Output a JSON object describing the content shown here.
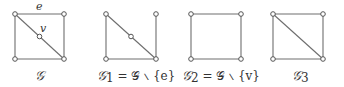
{
  "figure": {
    "graphs": [
      {
        "id": "G",
        "caption": {
          "script": "𝒢",
          "sub": "",
          "rest": ""
        },
        "vertices": [
          [
            15,
            14
          ],
          [
            64,
            14
          ],
          [
            15,
            59
          ],
          [
            64,
            59
          ],
          [
            39.5,
            36.5
          ]
        ],
        "edges": [
          [
            0,
            1
          ],
          [
            1,
            3
          ],
          [
            3,
            2
          ],
          [
            2,
            0
          ],
          [
            0,
            4
          ],
          [
            4,
            3
          ]
        ],
        "edge_label": "e",
        "vertex_label": "v"
      },
      {
        "id": "G1",
        "caption": {
          "script": "𝒢",
          "sub": "1",
          "rest": " = 𝒢 ∖ {e}"
        },
        "vertices": [
          [
            106,
            14
          ],
          [
            156,
            14
          ],
          [
            106,
            59
          ],
          [
            156,
            59
          ],
          [
            131,
            36.5
          ]
        ],
        "edges": [
          [
            1,
            3
          ],
          [
            3,
            2
          ],
          [
            2,
            0
          ],
          [
            0,
            4
          ],
          [
            4,
            3
          ]
        ]
      },
      {
        "id": "G2",
        "caption": {
          "script": "𝒢",
          "sub": "2",
          "rest": " = 𝒢 ∖ {v}"
        },
        "vertices": [
          [
            191,
            14
          ],
          [
            241,
            14
          ],
          [
            191,
            59
          ],
          [
            241,
            59
          ]
        ],
        "edges": [
          [
            0,
            1
          ],
          [
            1,
            3
          ],
          [
            3,
            2
          ],
          [
            2,
            0
          ]
        ]
      },
      {
        "id": "G3",
        "caption": {
          "script": "𝒢",
          "sub": "3",
          "rest": ""
        },
        "vertices": [
          [
            273,
            14
          ],
          [
            323,
            14
          ],
          [
            273,
            59
          ],
          [
            323,
            59
          ]
        ],
        "edges": [
          [
            0,
            1
          ],
          [
            1,
            3
          ],
          [
            3,
            2
          ],
          [
            2,
            0
          ],
          [
            0,
            3
          ]
        ]
      }
    ],
    "labels": {
      "e": "e",
      "v": "v",
      "g": "𝒢",
      "g1_main": "𝒢",
      "g1_sub": "1",
      "g1_rest": " = 𝒢 ∖ {e}",
      "g2_main": "𝒢",
      "g2_sub": "2",
      "g2_rest": " = 𝒢 ∖ {v}",
      "g3_main": "𝒢",
      "g3_sub": "3"
    }
  }
}
